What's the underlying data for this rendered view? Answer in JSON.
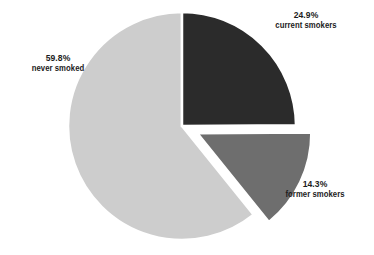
{
  "chart_data": {
    "type": "pie",
    "title": "",
    "categories": [
      "current smokers",
      "former smokers",
      "never smoked"
    ],
    "values": [
      24.9,
      14.3,
      59.8
    ],
    "value_labels": [
      "24.9%",
      "14.3%",
      "59.8%"
    ],
    "units": "percent",
    "legend": "none",
    "grid": false,
    "slices": [
      {
        "label": "current smokers",
        "percent_text": "24.9%",
        "value": 24.9,
        "color": "#2b2b2b",
        "start_angle_deg": 0,
        "end_angle_deg": 89.6,
        "exploded": false
      },
      {
        "label": "former smokers",
        "percent_text": "14.3%",
        "value": 14.3,
        "color": "#6e6e6e",
        "start_angle_deg": 89.6,
        "end_angle_deg": 141.1,
        "exploded": true
      },
      {
        "label": "never smoked",
        "percent_text": "59.8%",
        "value": 59.8,
        "color": "#cdcdcd",
        "start_angle_deg": 141.1,
        "end_angle_deg": 360,
        "exploded": false
      }
    ]
  },
  "labels": {
    "current": {
      "percent": "24.9%",
      "category": "current smokers"
    },
    "former": {
      "percent": "14.3%",
      "category": "former smokers"
    },
    "never": {
      "percent": "59.8%",
      "category": "never smoked"
    }
  },
  "colors": {
    "background": "#ffffff",
    "text": "#1c1c1c",
    "current_smokers": "#2b2b2b",
    "former_smokers": "#6e6e6e",
    "never_smoked": "#cdcdcd"
  }
}
